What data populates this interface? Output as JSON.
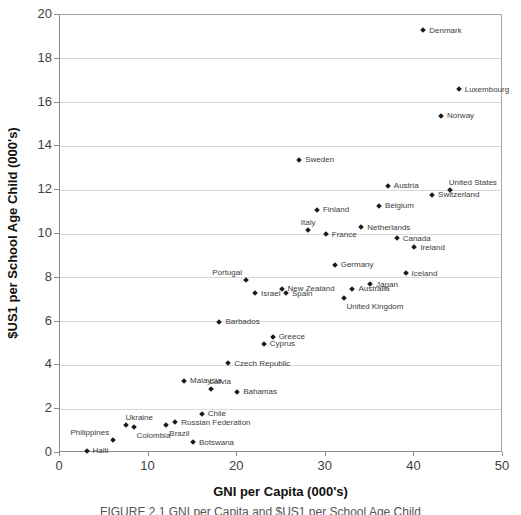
{
  "chart_data": {
    "type": "scatter",
    "title": "",
    "xlabel": "GNI per Capita (000's)",
    "ylabel": "$US1 per School Age Child (000's)",
    "xlim": [
      0,
      50
    ],
    "ylim": [
      0,
      20
    ],
    "x_ticks": [
      0,
      10,
      20,
      30,
      40,
      50
    ],
    "y_ticks": [
      0,
      2,
      4,
      6,
      8,
      10,
      12,
      14,
      16,
      18,
      20
    ],
    "grid": "horizontal-only",
    "legend": "none",
    "marker_shape": "diamond",
    "points": [
      {
        "name": "Denmark",
        "x": 41,
        "y": 19.3,
        "label_pos": "right"
      },
      {
        "name": "Luxembourg",
        "x": 45,
        "y": 16.6,
        "label_pos": "right"
      },
      {
        "name": "Norway",
        "x": 43,
        "y": 15.4,
        "label_pos": "right"
      },
      {
        "name": "Sweden",
        "x": 27,
        "y": 13.4,
        "label_pos": "right"
      },
      {
        "name": "Austria",
        "x": 37,
        "y": 12.2,
        "label_pos": "right"
      },
      {
        "name": "United States",
        "x": 44,
        "y": 12.0,
        "label_pos": "above"
      },
      {
        "name": "Switzerland",
        "x": 42,
        "y": 11.8,
        "label_pos": "right"
      },
      {
        "name": "Belgium",
        "x": 36,
        "y": 11.3,
        "label_pos": "right"
      },
      {
        "name": "Finland",
        "x": 29,
        "y": 11.1,
        "label_pos": "right"
      },
      {
        "name": "Netherlands",
        "x": 34,
        "y": 10.3,
        "label_pos": "right"
      },
      {
        "name": "Italy",
        "x": 28,
        "y": 10.2,
        "label_pos": "above-center"
      },
      {
        "name": "France",
        "x": 30,
        "y": 10.0,
        "label_pos": "right"
      },
      {
        "name": "Canada",
        "x": 38,
        "y": 9.8,
        "label_pos": "right"
      },
      {
        "name": "Ireland",
        "x": 40,
        "y": 9.4,
        "label_pos": "right"
      },
      {
        "name": "Germany",
        "x": 31,
        "y": 8.6,
        "label_pos": "right"
      },
      {
        "name": "Iceland",
        "x": 39,
        "y": 8.2,
        "label_pos": "right"
      },
      {
        "name": "Portugal",
        "x": 21,
        "y": 7.9,
        "label_pos": "above-left"
      },
      {
        "name": "Japan",
        "x": 35,
        "y": 7.7,
        "label_pos": "right"
      },
      {
        "name": "New Zealand",
        "x": 25,
        "y": 7.5,
        "label_pos": "right"
      },
      {
        "name": "Australia",
        "x": 33,
        "y": 7.5,
        "label_pos": "right"
      },
      {
        "name": "Israel",
        "x": 22,
        "y": 7.3,
        "label_pos": "right"
      },
      {
        "name": "Spain",
        "x": 25.5,
        "y": 7.3,
        "label_pos": "right"
      },
      {
        "name": "United Kingdom",
        "x": 32,
        "y": 7.1,
        "label_pos": "below"
      },
      {
        "name": "Barbados",
        "x": 18,
        "y": 6.0,
        "label_pos": "right"
      },
      {
        "name": "Greece",
        "x": 24,
        "y": 5.3,
        "label_pos": "right"
      },
      {
        "name": "Cyprus",
        "x": 23,
        "y": 5.0,
        "label_pos": "right"
      },
      {
        "name": "Czech Republic",
        "x": 19,
        "y": 4.1,
        "label_pos": "right"
      },
      {
        "name": "Malaysia",
        "x": 14,
        "y": 3.3,
        "label_pos": "right"
      },
      {
        "name": "Latvia",
        "x": 17,
        "y": 2.9,
        "label_pos": "above"
      },
      {
        "name": "Bahamas",
        "x": 20,
        "y": 2.8,
        "label_pos": "right"
      },
      {
        "name": "Chile",
        "x": 16,
        "y": 1.8,
        "label_pos": "right"
      },
      {
        "name": "Russian Federation",
        "x": 13,
        "y": 1.4,
        "label_pos": "right"
      },
      {
        "name": "Brazil",
        "x": 12,
        "y": 1.3,
        "label_pos": "below"
      },
      {
        "name": "Ukraine",
        "x": 7.5,
        "y": 1.3,
        "label_pos": "above"
      },
      {
        "name": "Colombia",
        "x": 8.3,
        "y": 1.2,
        "label_pos": "below"
      },
      {
        "name": "Philippines",
        "x": 6,
        "y": 0.6,
        "label_pos": "above-left"
      },
      {
        "name": "Botswana",
        "x": 15,
        "y": 0.5,
        "label_pos": "right"
      },
      {
        "name": "Haiti",
        "x": 3,
        "y": 0.1,
        "label_pos": "right"
      }
    ]
  },
  "figure_caption": "FIGURE 2.1    GNI per Capita and $US1 per School Age Child",
  "colors": {
    "marker": "#1c1c1c",
    "point_label": "#3c3c3c",
    "gridline": "#d8d8d8",
    "axis_line": "#8c8c8c",
    "tick_label": "#3f3f3f",
    "axis_title": "#111111",
    "background": "#ffffff"
  }
}
